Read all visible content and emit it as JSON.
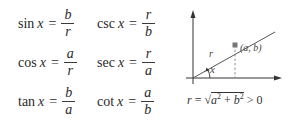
{
  "formulas": {
    "col1": [
      {
        "fn": "sin",
        "var": "x",
        "eq": "=",
        "num": "b",
        "den": "r"
      },
      {
        "fn": "cos",
        "var": "x",
        "eq": "=",
        "num": "a",
        "den": "r"
      },
      {
        "fn": "tan",
        "var": "x",
        "eq": "=",
        "num": "b",
        "den": "a"
      }
    ],
    "col2": [
      {
        "fn": "csc",
        "var": "x",
        "eq": "=",
        "num": "r",
        "den": "b"
      },
      {
        "fn": "sec",
        "var": "x",
        "eq": "=",
        "num": "r",
        "den": "a"
      },
      {
        "fn": "cot",
        "var": "x",
        "eq": "=",
        "num": "a",
        "den": "b"
      }
    ]
  },
  "diagram": {
    "radius_label": "r",
    "angle_label": "x",
    "point_label": "(a, b)",
    "line_color": "#555555",
    "point_color": "#777777"
  },
  "radius_equation": {
    "lhs": "r",
    "eq": "=",
    "sqrt": "√",
    "a": "a",
    "a_exp": "2",
    "plus": "+",
    "b": "b",
    "b_exp": "2",
    "rel": "> 0"
  }
}
